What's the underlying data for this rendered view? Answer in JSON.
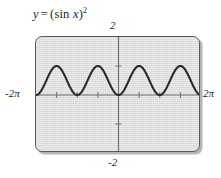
{
  "figure": {
    "title": {
      "full": "y = (sin x)^2",
      "lhs": "y",
      "operator": "=",
      "open_paren": "(",
      "function": "sin",
      "argument": "x",
      "close_paren": ")",
      "exponent": "2"
    },
    "colors": {
      "plot_background": "#dddddd",
      "frame_border": "#575757",
      "curve": "#2b2b2b",
      "axis": "#6e6e6e",
      "text": "#1e1e1e",
      "page_background": "#ffffff"
    }
  },
  "labels": {
    "y_max": "2",
    "y_min": "-2",
    "x_min": "-2π",
    "x_max": "2π"
  },
  "chart_data": {
    "type": "line",
    "xlabel": "",
    "ylabel": "",
    "xlim": [
      -6.283185307179586,
      6.283185307179586
    ],
    "ylim": [
      -2,
      2
    ],
    "xtick_labels": [
      "-2π",
      "2π"
    ],
    "ytick_labels": [
      "2",
      "-2"
    ],
    "xticks": [
      -4.71238898038469,
      -3.141592653589793,
      -1.5707963267948966,
      0,
      1.5707963267948966,
      3.141592653589793,
      4.71238898038469
    ],
    "yticks": [
      -1,
      1
    ],
    "grid": false,
    "legend": false,
    "series": [
      {
        "name": "y = (sin x)^2",
        "formula": "sin(x)^2",
        "period": 3.141592653589793,
        "amplitude": 1,
        "minimum": 0,
        "maximum": 1,
        "x": [
          -6.283185307179586,
          -5.890486225480862,
          -5.497787143782138,
          -5.105088062083414,
          -4.71238898038469,
          -4.319689898685965,
          -3.9269908169872414,
          -3.5342917352885173,
          -3.141592653589793,
          -2.748893571891069,
          -2.356194490192345,
          -1.9634954084936207,
          -1.5707963267948966,
          -1.1780972450961724,
          -0.7853981633974483,
          -0.39269908169872414,
          0,
          0.39269908169872414,
          0.7853981633974483,
          1.1780972450961724,
          1.5707963267948966,
          1.9634954084936207,
          2.356194490192345,
          2.748893571891069,
          3.141592653589793,
          3.5342917352885173,
          3.9269908169872414,
          4.319689898685965,
          4.71238898038469,
          5.105088062083414,
          5.497787143782138,
          5.890486225480862,
          6.283185307179586
        ],
        "y": [
          0,
          0.1464,
          0.5,
          0.8536,
          1,
          0.8536,
          0.5,
          0.1464,
          0,
          0.1464,
          0.5,
          0.8536,
          1,
          0.8536,
          0.5,
          0.1464,
          0,
          0.1464,
          0.5,
          0.8536,
          1,
          0.8536,
          0.5,
          0.1464,
          0,
          0.1464,
          0.5,
          0.8536,
          1,
          0.8536,
          0.5,
          0.1464,
          0
        ]
      }
    ],
    "annotations": [
      {
        "text": "2",
        "position": "above-top-of-y-axis"
      },
      {
        "text": "-2",
        "position": "below-bottom-of-y-axis"
      },
      {
        "text": "-2π",
        "position": "left-of-x-axis"
      },
      {
        "text": "2π",
        "position": "right-of-x-axis"
      }
    ]
  }
}
